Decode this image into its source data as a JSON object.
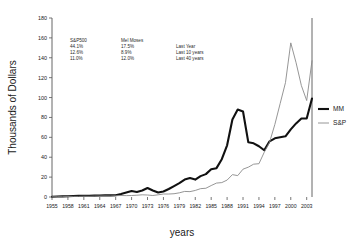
{
  "chart_data": {
    "type": "line",
    "title": "",
    "xlabel": "years",
    "ylabel": "Thousands of Dollars",
    "xlim": [
      1955,
      2004
    ],
    "ylim": [
      0,
      180
    ],
    "grid": false,
    "legend_position": "right-outside",
    "y_ticks": [
      0,
      20,
      40,
      60,
      80,
      100,
      120,
      140,
      160,
      180
    ],
    "x_ticks": [
      1955,
      1958,
      1961,
      1964,
      1967,
      1970,
      1973,
      1976,
      1979,
      1982,
      1985,
      1988,
      1991,
      1994,
      1997,
      2000,
      2003
    ],
    "x": [
      1955,
      1956,
      1957,
      1958,
      1959,
      1960,
      1961,
      1962,
      1963,
      1964,
      1965,
      1966,
      1967,
      1968,
      1969,
      1970,
      1971,
      1972,
      1973,
      1974,
      1975,
      1976,
      1977,
      1978,
      1979,
      1980,
      1981,
      1982,
      1983,
      1984,
      1985,
      1986,
      1987,
      1988,
      1989,
      1990,
      1991,
      1992,
      1993,
      1994,
      1995,
      1996,
      1997,
      1998,
      1999,
      2000,
      2001,
      2002,
      2003,
      2004
    ],
    "series": [
      {
        "name": "MM",
        "color": "#111111",
        "width": "thick",
        "values": [
          0.3,
          0.5,
          0.6,
          0.8,
          1.0,
          1.1,
          1.3,
          1.3,
          1.4,
          1.5,
          1.6,
          1.6,
          1.8,
          3.0,
          4.5,
          6.0,
          5.0,
          6.5,
          9.0,
          6.5,
          4.5,
          5.5,
          8.0,
          11.0,
          14.0,
          17.5,
          19.0,
          17.5,
          21.0,
          23.0,
          28.0,
          29.0,
          38.0,
          52.0,
          78.0,
          88.0,
          86.0,
          55.0,
          54.0,
          51.0,
          47.0,
          56.0,
          59.0,
          60.0,
          61.0,
          68.0,
          74.0,
          79.0,
          79.0,
          99.0
        ]
      },
      {
        "name": "S&P",
        "color": "#8a8a8a",
        "width": "thin",
        "values": [
          0.2,
          0.3,
          0.3,
          0.5,
          0.6,
          0.6,
          0.8,
          0.7,
          0.9,
          1.0,
          1.1,
          1.0,
          1.3,
          1.5,
          1.4,
          1.5,
          1.8,
          2.2,
          2.0,
          1.5,
          2.2,
          3.0,
          3.0,
          3.3,
          4.2,
          5.6,
          5.4,
          6.6,
          8.4,
          8.8,
          11.5,
          14.0,
          14.5,
          17.0,
          22.5,
          21.5,
          28.0,
          30.0,
          33.0,
          33.5,
          45.0,
          55.0,
          73.0,
          94.0,
          115.0,
          155.0,
          135.0,
          112.0,
          97.0,
          137.0
        ]
      }
    ]
  },
  "annotation": {
    "columns": [
      {
        "header": "S&P500",
        "values": [
          "44.1%",
          "12.6%",
          "11.0%"
        ]
      },
      {
        "header": "Mel Moses",
        "values": [
          "17.5%",
          "8.9%",
          "12.0%"
        ]
      },
      {
        "header": "",
        "values": [
          "Last Year",
          "Last 10 years",
          "Last 40 years"
        ]
      }
    ]
  },
  "legend": {
    "entries": [
      {
        "label": "MM"
      },
      {
        "label": "S&P"
      }
    ]
  }
}
